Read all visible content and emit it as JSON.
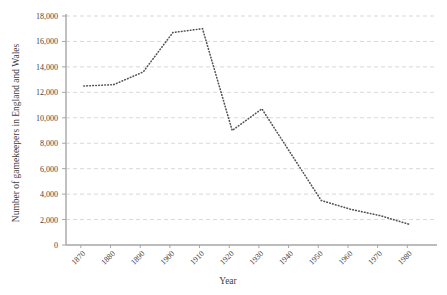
{
  "chart_data": {
    "type": "line",
    "title": "",
    "xlabel": "Year",
    "ylabel": "Number of gamekeepers in England and Wales",
    "xlim": [
      1865,
      1990
    ],
    "ylim": [
      0,
      18000
    ],
    "grid": true,
    "legend": "none",
    "line_style": "dotted",
    "line_color": "#555555",
    "x_tick_labels": [
      "1870",
      "1880",
      "1890",
      "1900",
      "1910",
      "1920",
      "1930",
      "1940",
      "1950",
      "1960",
      "1970",
      "1980"
    ],
    "x_ticks": [
      1870,
      1880,
      1890,
      1900,
      1910,
      1920,
      1930,
      1940,
      1950,
      1960,
      1970,
      1980
    ],
    "y_tick_labels": [
      "0",
      "2,000",
      "4,000",
      "6,000",
      "8,000",
      "10,000",
      "12,000",
      "14,000",
      "16,000",
      "18,000"
    ],
    "y_ticks": [
      0,
      2000,
      4000,
      6000,
      8000,
      10000,
      12000,
      14000,
      16000,
      18000
    ],
    "series": [
      {
        "name": "Gamekeepers",
        "x": [
          1871,
          1881,
          1891,
          1901,
          1911,
          1921,
          1931,
          1951,
          1961,
          1971,
          1981
        ],
        "values": [
          12500,
          12600,
          13600,
          16700,
          17000,
          9000,
          10700,
          3500,
          2800,
          2300,
          1600
        ]
      }
    ]
  },
  "axis": {
    "x_title": "Year",
    "y_title": "Number of gamekeepers in England and Wales"
  },
  "colors": {
    "grid": "#d9d9d9",
    "axis": "#a6a6a6",
    "series": "#555555",
    "text": "#3f3f3f",
    "background": "#ffffff"
  }
}
